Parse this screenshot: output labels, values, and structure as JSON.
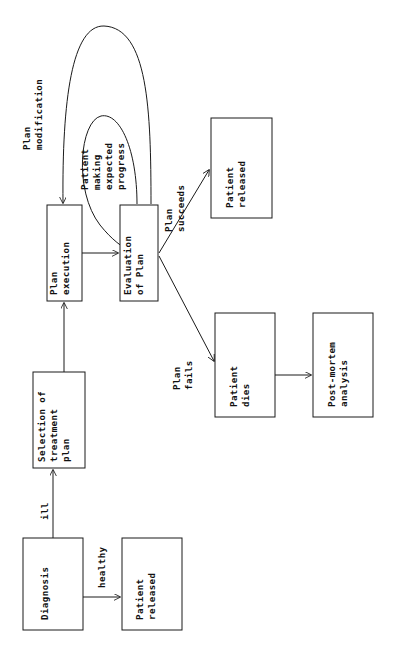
{
  "diagram": {
    "orientation": "rotated-90-ccw",
    "stroke_color": "#1a1a1a",
    "text_color": "#111111",
    "background_color": "#ffffff",
    "nodes": [
      {
        "id": "diagnosis",
        "lines": [
          "Diagnosis"
        ],
        "x": 23,
        "y": 538,
        "w": 60,
        "h": 92
      },
      {
        "id": "patient-released-healthy",
        "lines": [
          "Patient",
          "released"
        ],
        "x": 122,
        "y": 538,
        "w": 60,
        "h": 92
      },
      {
        "id": "selection-of-treatment-plan",
        "lines": [
          "Selection of",
          "treatment",
          "plan"
        ],
        "x": 33,
        "y": 372,
        "w": 52,
        "h": 96
      },
      {
        "id": "plan-execution",
        "lines": [
          "Plan",
          "execution"
        ],
        "x": 47,
        "y": 205,
        "w": 35,
        "h": 96
      },
      {
        "id": "evaluation-of-plan",
        "lines": [
          "Evaluation",
          "of Plan"
        ],
        "x": 120,
        "y": 205,
        "w": 38,
        "h": 96
      },
      {
        "id": "patient-released-success",
        "lines": [
          "Patient",
          "released"
        ],
        "x": 211,
        "y": 118,
        "w": 61,
        "h": 100
      },
      {
        "id": "patient-dies",
        "lines": [
          "Patient",
          "dies"
        ],
        "x": 215,
        "y": 313,
        "w": 60,
        "h": 104
      },
      {
        "id": "post-mortem-analysis",
        "lines": [
          "Post-mortem",
          "analysis"
        ],
        "x": 313,
        "y": 313,
        "w": 60,
        "h": 104
      }
    ],
    "edges": [
      {
        "id": "diagnosis-to-selection",
        "from": "diagnosis",
        "to": "selection-of-treatment-plan",
        "label_lines": [
          "ill"
        ]
      },
      {
        "id": "diagnosis-to-released-healthy",
        "from": "diagnosis",
        "to": "patient-released-healthy",
        "label_lines": [
          "healthy"
        ]
      },
      {
        "id": "selection-to-plan-execution",
        "from": "selection-of-treatment-plan",
        "to": "plan-execution",
        "label_lines": []
      },
      {
        "id": "plan-execution-to-evaluation",
        "from": "plan-execution",
        "to": "evaluation-of-plan",
        "label_lines": []
      },
      {
        "id": "evaluation-to-plan-execution-modification",
        "from": "evaluation-of-plan",
        "to": "plan-execution",
        "label_lines": [
          "Plan",
          "modification"
        ]
      },
      {
        "id": "evaluation-to-evaluation-progress",
        "from": "evaluation-of-plan",
        "to": "evaluation-of-plan",
        "label_lines": [
          "Patient",
          "making",
          "expected",
          "progress"
        ]
      },
      {
        "id": "evaluation-to-released-success",
        "from": "evaluation-of-plan",
        "to": "patient-released-success",
        "label_lines": [
          "Plan",
          "succeeds"
        ]
      },
      {
        "id": "evaluation-to-patient-dies",
        "from": "evaluation-of-plan",
        "to": "patient-dies",
        "label_lines": [
          "Plan",
          "fails"
        ]
      },
      {
        "id": "patient-dies-to-post-mortem",
        "from": "patient-dies",
        "to": "post-mortem-analysis",
        "label_lines": []
      }
    ]
  },
  "labels": {
    "diagnosis": "Diagnosis",
    "patient": "Patient",
    "released": "released",
    "selection_of": "Selection of",
    "treatment": "treatment",
    "plan_lower": "plan",
    "plan": "Plan",
    "execution": "execution",
    "evaluation": "Evaluation",
    "of_plan": "of Plan",
    "dies": "dies",
    "post_mortem": "Post-mortem",
    "analysis": "analysis",
    "ill": "ill",
    "healthy": "healthy",
    "modification": "modification",
    "making": "making",
    "expected": "expected",
    "progress": "progress",
    "succeeds": "succeeds",
    "fails": "fails"
  }
}
